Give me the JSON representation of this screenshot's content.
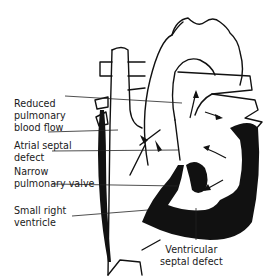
{
  "diagram": {
    "labels": {
      "reduced_flow": "Reduced\npulmonary\nblood flow",
      "atrial_septal_defect": "Atrial septal\ndefect",
      "narrow_valve": "Narrow\npulmonary valve",
      "small_right_ventricle": "Small right\nventricle",
      "ventricular_septal_defect": "Ventricular\nseptal defect"
    },
    "colors": {
      "ink": "#111111",
      "background": "#ffffff",
      "text": "#1a1a1a"
    }
  }
}
